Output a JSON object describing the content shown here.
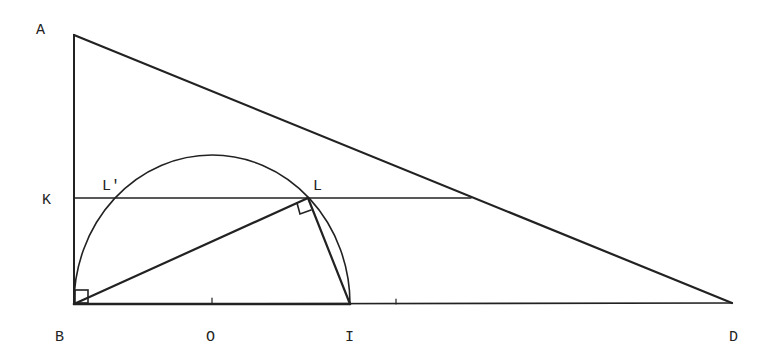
{
  "diagram": {
    "type": "geometry-construction",
    "stroke_color": "#222222",
    "background": "#ffffff",
    "points": {
      "A": {
        "label": "A",
        "x": 74,
        "y": 35,
        "label_x": 36,
        "label_y": 34
      },
      "B": {
        "label": "B",
        "x": 74,
        "y": 304,
        "label_x": 55,
        "label_y": 341
      },
      "K": {
        "label": "K",
        "x": 74,
        "y": 198,
        "label_x": 42,
        "label_y": 204
      },
      "O": {
        "label": "O",
        "x": 212,
        "y": 304,
        "label_x": 206,
        "label_y": 341
      },
      "I": {
        "label": "I",
        "x": 350,
        "y": 304,
        "label_x": 345,
        "label_y": 341
      },
      "D": {
        "label": "D",
        "x": 732,
        "y": 303,
        "label_x": 729,
        "label_y": 341
      },
      "L": {
        "label": "L",
        "x": 308,
        "y": 198,
        "label_x": 313,
        "label_y": 190
      },
      "Lp": {
        "label": "L'",
        "x": 116,
        "y": 198,
        "label_x": 102,
        "label_y": 190
      }
    },
    "segments": [
      {
        "name": "AB",
        "from": "A",
        "to": "B"
      },
      {
        "name": "AD",
        "from": "A",
        "to": "D"
      },
      {
        "name": "BD",
        "from": "B",
        "to": "D"
      },
      {
        "name": "K-line",
        "from": "K",
        "to_x": 471,
        "to_y": 198
      },
      {
        "name": "BL",
        "from": "B",
        "to": "L"
      },
      {
        "name": "LI",
        "from": "L",
        "to": "I"
      }
    ],
    "arc": {
      "name": "semicircle-BI",
      "center": "O",
      "rx": 138,
      "ry": 149
    },
    "right_angles": [
      "B",
      "L"
    ],
    "ticks": [
      {
        "x": 212,
        "y": 304
      },
      {
        "x": 396,
        "y": 304
      }
    ]
  }
}
